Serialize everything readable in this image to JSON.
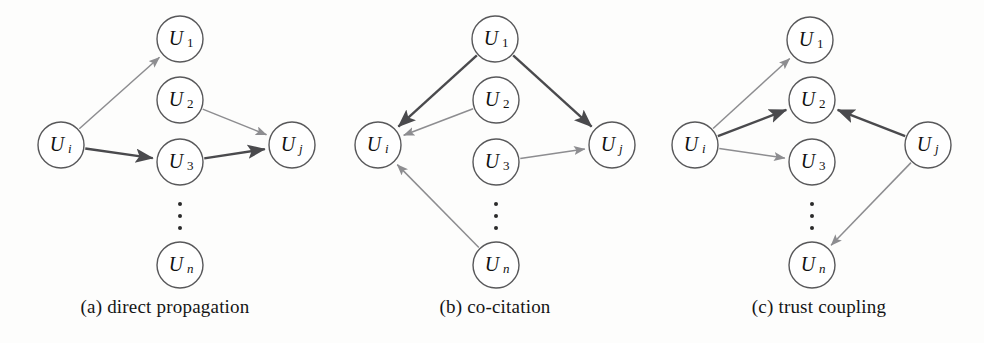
{
  "figure": {
    "background_color": "#fdfdfc",
    "edge_light_color": "#8d8d90",
    "edge_dark_color": "#4a4a4d",
    "node_stroke_color": "#58585a",
    "node_radius": 23
  },
  "panels": [
    {
      "id": "a",
      "caption": "(a) direct propagation",
      "nodes": [
        {
          "key": "ui",
          "label": "U",
          "sub": "i",
          "sub_style": "italic",
          "cx": 61,
          "cy": 145
        },
        {
          "key": "u1",
          "label": "U",
          "sub": "1",
          "sub_style": "roman",
          "cx": 180,
          "cy": 39
        },
        {
          "key": "u2",
          "label": "U",
          "sub": "2",
          "sub_style": "roman",
          "cx": 180,
          "cy": 100
        },
        {
          "key": "u3",
          "label": "U",
          "sub": "3",
          "sub_style": "roman",
          "cx": 180,
          "cy": 162
        },
        {
          "key": "un",
          "label": "U",
          "sub": "n",
          "sub_style": "italic",
          "cx": 180,
          "cy": 265
        },
        {
          "key": "uj",
          "label": "U",
          "sub": "j",
          "sub_style": "italic",
          "cx": 292,
          "cy": 145
        }
      ],
      "vertical_dots": {
        "cx": 180,
        "cys": [
          204,
          216,
          228
        ],
        "r": 2
      },
      "edges": [
        {
          "from": "ui",
          "to": "u1",
          "weight": "light"
        },
        {
          "from": "ui",
          "to": "u3",
          "weight": "dark"
        },
        {
          "from": "u2",
          "to": "uj",
          "weight": "light"
        },
        {
          "from": "u3",
          "to": "uj",
          "weight": "dark"
        }
      ]
    },
    {
      "id": "b",
      "caption": "(b) co-citation",
      "nodes": [
        {
          "key": "ui",
          "label": "U",
          "sub": "i",
          "sub_style": "italic",
          "cx": 378,
          "cy": 145
        },
        {
          "key": "u1",
          "label": "U",
          "sub": "1",
          "sub_style": "roman",
          "cx": 495,
          "cy": 39
        },
        {
          "key": "u2",
          "label": "U",
          "sub": "2",
          "sub_style": "roman",
          "cx": 496,
          "cy": 100
        },
        {
          "key": "u3",
          "label": "U",
          "sub": "3",
          "sub_style": "roman",
          "cx": 496,
          "cy": 162
        },
        {
          "key": "un",
          "label": "U",
          "sub": "n",
          "sub_style": "italic",
          "cx": 496,
          "cy": 265
        },
        {
          "key": "uj",
          "label": "U",
          "sub": "j",
          "sub_style": "italic",
          "cx": 612,
          "cy": 145
        }
      ],
      "vertical_dots": {
        "cx": 496,
        "cys": [
          204,
          216,
          228
        ],
        "r": 2
      },
      "edges": [
        {
          "from": "u1",
          "to": "ui",
          "weight": "dark"
        },
        {
          "from": "u1",
          "to": "uj",
          "weight": "dark"
        },
        {
          "from": "u2",
          "to": "ui",
          "weight": "light"
        },
        {
          "from": "u3",
          "to": "uj",
          "weight": "light"
        },
        {
          "from": "un",
          "to": "ui",
          "weight": "light"
        }
      ]
    },
    {
      "id": "c",
      "caption": "(c) trust coupling",
      "nodes": [
        {
          "key": "ui",
          "label": "U",
          "sub": "i",
          "sub_style": "italic",
          "cx": 695,
          "cy": 145
        },
        {
          "key": "u1",
          "label": "U",
          "sub": "1",
          "sub_style": "roman",
          "cx": 810,
          "cy": 40
        },
        {
          "key": "u2",
          "label": "U",
          "sub": "2",
          "sub_style": "roman",
          "cx": 812,
          "cy": 100
        },
        {
          "key": "u3",
          "label": "U",
          "sub": "3",
          "sub_style": "roman",
          "cx": 812,
          "cy": 162
        },
        {
          "key": "un",
          "label": "U",
          "sub": "n",
          "sub_style": "italic",
          "cx": 812,
          "cy": 265
        },
        {
          "key": "uj",
          "label": "U",
          "sub": "j",
          "sub_style": "italic",
          "cx": 928,
          "cy": 145
        }
      ],
      "vertical_dots": {
        "cx": 812,
        "cys": [
          204,
          216,
          228
        ],
        "r": 2
      },
      "edges": [
        {
          "from": "ui",
          "to": "u1",
          "weight": "light"
        },
        {
          "from": "ui",
          "to": "u2",
          "weight": "dark"
        },
        {
          "from": "ui",
          "to": "u3",
          "weight": "light"
        },
        {
          "from": "uj",
          "to": "u2",
          "weight": "dark"
        },
        {
          "from": "uj",
          "to": "un",
          "weight": "light"
        }
      ]
    }
  ]
}
